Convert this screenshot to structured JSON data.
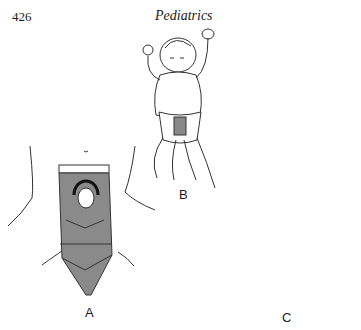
{
  "header": {
    "page_number": "426",
    "running_title": "Pediatrics"
  },
  "figure": {
    "panels": [
      {
        "label": "A",
        "description": "Close-up of dressing over abdominal wall with opening, dark ring around umbilical area"
      },
      {
        "label": "B",
        "description": "Infant lying supine wearing diaper with dressing on abdomen"
      },
      {
        "label": "C",
        "description": "Close-up of dressing with opening, alternate configuration"
      }
    ],
    "colors": {
      "dressing_fill": "#8a8a8a",
      "line": "#2a2a2a",
      "background": "#ffffff"
    }
  }
}
